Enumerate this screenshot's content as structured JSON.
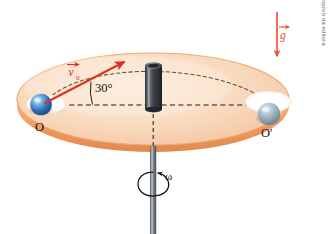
{
  "figure": {
    "background_color": "#ffffff",
    "disk": {
      "top_color_light": "#fbe3cf",
      "top_color_mid": "#f6cfae",
      "rim_color": "#f0a06a",
      "rim_shadow": "#e08a50"
    },
    "rod": {
      "color_dark": "#3a3f44",
      "color_light": "#9aa3ab",
      "cylinder_top": "#6b737b"
    },
    "labels": {
      "point_o": "O",
      "point_o_prime": "O'",
      "angle": "30°",
      "velocity_vector": "v",
      "velocity_subscript": "0",
      "gravity_vector": "g",
      "omega": "ω"
    },
    "colors": {
      "velocity_arrow": "#e03021",
      "gravity_arrow": "#ef4a32",
      "dashed_line": "#1b1b1b",
      "trajectory_dash": "#6b4a2f",
      "sphere_blue_dark": "#2f6fb5",
      "sphere_blue_light": "#8fc4ea",
      "sphere_gray": "#8fa5b4"
    },
    "credit": "Banco de imagens/Arquivo da editora"
  }
}
